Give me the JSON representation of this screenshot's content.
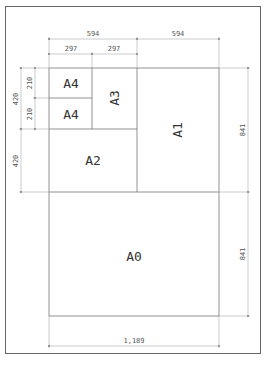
{
  "diagram": {
    "type": "paper-size-diagram",
    "sheets": [
      {
        "label": "A0"
      },
      {
        "label": "A1"
      },
      {
        "label": "A2"
      },
      {
        "label": "A3"
      },
      {
        "label": "A4",
        "position": "top"
      },
      {
        "label": "A4",
        "position": "bottom"
      }
    ],
    "dimensions": {
      "top_overall": "594",
      "top_right": "594",
      "top_a4_width": "297",
      "top_a3_width": "297",
      "left_upper_overall": "420",
      "left_a4_top": "210",
      "left_a4_bottom": "210",
      "left_lower": "420",
      "right_upper": "841",
      "right_lower": "841",
      "bottom_overall": "1,189"
    },
    "caption": ""
  }
}
